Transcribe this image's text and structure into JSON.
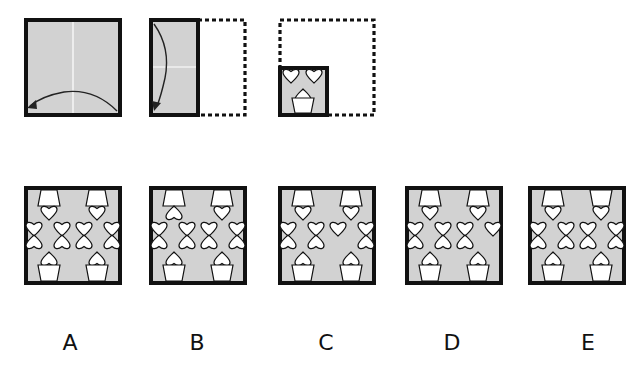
{
  "colors": {
    "paper_fill": "#d2d2d2",
    "outline": "#111111",
    "crease": "#ffffff",
    "shape_fill": "#ffffff",
    "background": "#ffffff"
  },
  "steps": [
    {
      "id": "step-1",
      "description": "Full square with vertical crease; arrow folds right half over to left",
      "fold": "right-to-left"
    },
    {
      "id": "step-2",
      "description": "Half-width rectangle with horizontal crease and dashed outline of unfolded half; arrow folds top down",
      "fold": "top-to-bottom"
    },
    {
      "id": "step-3",
      "description": "Quarter square with punched shapes: two hearts at top, one heart in a pot at bottom; dashed outline of original square",
      "shapes": [
        "heart",
        "heart",
        "heart-in-pot"
      ]
    }
  ],
  "options": [
    {
      "label": "A",
      "top_left_heart": "down",
      "top_right_pot": "normal",
      "missing": "none"
    },
    {
      "label": "B",
      "top_left_heart": "up",
      "top_right_pot": "normal",
      "missing": "none"
    },
    {
      "label": "C",
      "top_left_heart": "down",
      "top_right_pot": "normal",
      "missing": "inner-right-lower"
    },
    {
      "label": "D",
      "top_left_heart": "down",
      "top_right_pot": "normal",
      "missing": "outer-right-lower"
    },
    {
      "label": "E",
      "top_left_heart": "down",
      "top_right_pot": "inverted",
      "missing": "none"
    }
  ]
}
